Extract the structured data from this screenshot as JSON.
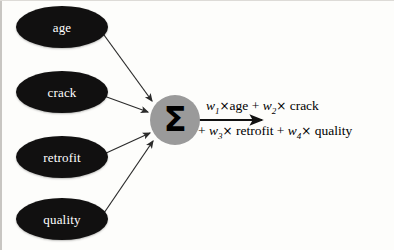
{
  "diagram": {
    "type": "neural-network-perceptron",
    "background_color": "#fdfdfb",
    "input_nodes": [
      {
        "id": "age",
        "label": "age",
        "shape": "ellipse",
        "fill": "#111010",
        "text_color": "#ffffff",
        "cx": 62,
        "cy": 27,
        "rx": 46,
        "ry": 21
      },
      {
        "id": "crack",
        "label": "crack",
        "shape": "ellipse",
        "fill": "#111010",
        "text_color": "#ffffff",
        "cx": 62,
        "cy": 92,
        "rx": 46,
        "ry": 21
      },
      {
        "id": "retrofit",
        "label": "retrofit",
        "shape": "ellipse",
        "fill": "#111010",
        "text_color": "#ffffff",
        "cx": 62,
        "cy": 157,
        "rx": 46,
        "ry": 21
      },
      {
        "id": "quality",
        "label": "quality",
        "shape": "ellipse",
        "fill": "#111010",
        "text_color": "#ffffff",
        "cx": 62,
        "cy": 219,
        "rx": 46,
        "ry": 21
      }
    ],
    "sum_node": {
      "id": "summation",
      "symbol": "Σ",
      "shape": "circle",
      "fill": "#9a9a9a",
      "symbol_color": "#000000",
      "cx": 175,
      "cy": 120,
      "r": 25
    },
    "edges": [
      {
        "from": "age",
        "to": "summation",
        "label": ""
      },
      {
        "from": "crack",
        "to": "summation",
        "label": ""
      },
      {
        "from": "retrofit",
        "to": "summation",
        "label": ""
      },
      {
        "from": "quality",
        "to": "summation",
        "label": ""
      },
      {
        "from": "summation",
        "to": "output",
        "label": ""
      }
    ],
    "output_formula": {
      "line1_prefix": "",
      "terms": [
        {
          "weight": "w",
          "subscript": "1",
          "operator": "×",
          "variable": "age"
        },
        {
          "weight": "w",
          "subscript": "2",
          "operator": "×",
          "variable": "crack"
        },
        {
          "weight": "w",
          "subscript": "3",
          "operator": "×",
          "variable": "retrofit"
        },
        {
          "weight": "w",
          "subscript": "4",
          "operator": "×",
          "variable": "quality"
        }
      ],
      "plain_text": "w1×age + w2× crack + w3× retrofit + w4× quality",
      "line1": "w1×age + w2× crack",
      "line2": "+ w3× retrofit + w4× quality",
      "plus_sign": "+",
      "times_sign": "×"
    },
    "colors": {
      "node_fill": "#111010",
      "node_text": "#ffffff",
      "sum_fill": "#9a9a9a",
      "arrow": "#2b2b2b",
      "formula_text": "#000000"
    }
  }
}
